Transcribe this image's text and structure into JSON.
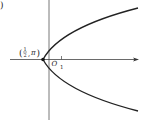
{
  "diagram": {
    "type": "polar-coordinate-plot",
    "corner_mark": ")",
    "point_label": {
      "open": "(",
      "frac_num": "1",
      "frac_den": "2",
      "sep": ",",
      "angle": "π",
      "close": ")"
    },
    "pole_label": "O",
    "tick_label": "1",
    "colors": {
      "curve": "#222222",
      "axis": "#444444"
    }
  }
}
